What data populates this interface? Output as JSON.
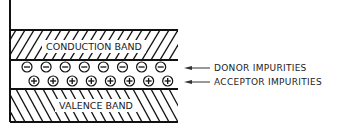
{
  "diagram": {
    "conduction_band": {
      "label": "CONDUCTION BAND",
      "hatch": "forward"
    },
    "valence_band": {
      "label": "VALENCE BAND",
      "hatch": "backward"
    },
    "donor_row": {
      "symbol": "−",
      "count": 8
    },
    "acceptor_row": {
      "symbol": "+",
      "count": 8
    },
    "annotations": [
      {
        "id": "donor",
        "label": "DONOR IMPURITIES"
      },
      {
        "id": "acceptor",
        "label": "ACCEPTOR IMPURITIES"
      }
    ],
    "colors": {
      "ink": "#111111",
      "background": "#ffffff"
    }
  }
}
